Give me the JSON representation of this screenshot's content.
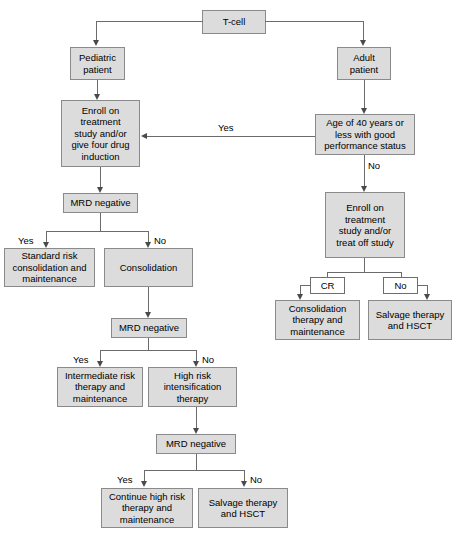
{
  "diagram": {
    "colors": {
      "node_fill": "#dcdcdc",
      "node_border": "#8a8a8a",
      "plain_fill": "#ffffff",
      "line": "#6b6b6b",
      "text": "#000000"
    },
    "nodes": {
      "t_cell": "T-cell",
      "pediatric_patient": "Pediatric\npatient",
      "adult_patient": "Adult\npatient",
      "enroll_pediatric": "Enroll on\ntreatment\nstudy and/or\ngive four drug\ninduction",
      "age_40": "Age of 40 years or\nless with good\nperformance status",
      "mrd_negative_1": "MRD negative",
      "standard_risk": "Standard risk\nconsolidation and\nmaintenance",
      "consolidation": "Consolidation",
      "enroll_adult": "Enroll on\ntreatment\nstudy and/or\ntreat off study",
      "cr": "CR",
      "no_box": "No",
      "consolidation_therapy": "Consolidation\ntherapy and\nmaintenance",
      "salvage_therapy_1": "Salvage therapy\nand HSCT",
      "mrd_negative_2": "MRD negative",
      "intermediate_risk": "Intermediate risk\ntherapy and\nmaintenance",
      "high_risk": "High risk\nintensification\ntherapy",
      "mrd_negative_3": "MRD negative",
      "continue_high_risk": "Continue high risk\ntherapy and\nmaintenance",
      "salvage_therapy_2": "Salvage therapy\nand HSCT"
    },
    "edge_labels": {
      "yes_age_to_enroll": "Yes",
      "no_age_to_enroll_adult": "No",
      "yes_mrd1": "Yes",
      "no_mrd1": "No",
      "yes_mrd2": "Yes",
      "no_mrd2": "No",
      "yes_mrd3": "Yes",
      "no_mrd3": "No"
    }
  }
}
